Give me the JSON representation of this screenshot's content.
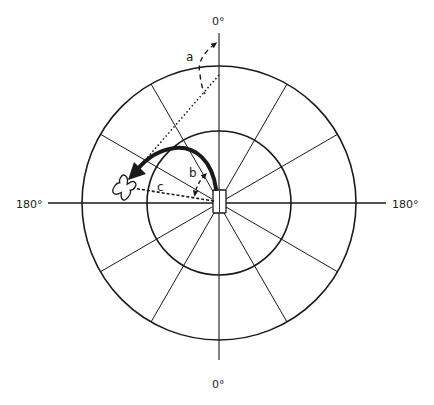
{
  "diagram": {
    "type": "polar-orientation-diagram",
    "colors": {
      "line": "#1a1a1a",
      "background": "#ffffff"
    },
    "axis_labels": {
      "top": "0°",
      "bottom": "0°",
      "left": "180°",
      "right": "180°"
    },
    "angle_labels": {
      "a": "a",
      "b": "b",
      "c": "c"
    },
    "rings": [
      {
        "name": "inner-ring",
        "radius": 72
      },
      {
        "name": "outer-ring",
        "radius": 137
      }
    ],
    "spokes": {
      "count": 12,
      "interval_deg": 30
    },
    "elements": [
      "center-block",
      "shoe-marker",
      "rotation-arrow",
      "dotted-sight-line",
      "dashed-direction-line",
      "angle-a-arc",
      "angle-b-arc"
    ]
  }
}
